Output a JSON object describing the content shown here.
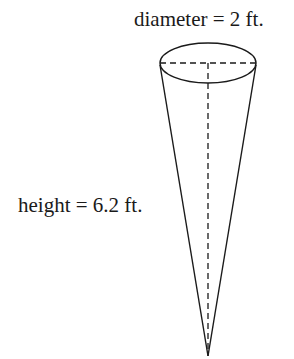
{
  "figure": {
    "shape": "inverted cone",
    "labels": {
      "diameter": "diameter = 2 ft.",
      "height": "height = 6.2 ft."
    },
    "colors": {
      "stroke": "#1a1a1a",
      "background": "#ffffff"
    }
  }
}
